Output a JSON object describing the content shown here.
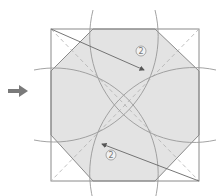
{
  "diagram": {
    "step_labels": [
      {
        "text": "2",
        "x": 141,
        "y": 54
      },
      {
        "text": "2",
        "x": 111,
        "y": 157
      }
    ],
    "pointer_arrow": {
      "direction": "right",
      "color": "#7a7a7a"
    },
    "colors": {
      "fill": "#e3e3e3",
      "line": "#8a8a8a",
      "dashed": "#b0b0b0",
      "arc": "#999999"
    },
    "square": {
      "x": 51,
      "y": 29,
      "size": 148,
      "height": 152
    },
    "center": {
      "x": 125,
      "y": 103
    }
  }
}
